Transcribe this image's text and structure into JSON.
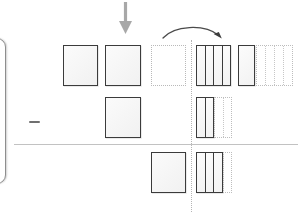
{
  "figure": {
    "title": "",
    "canvas": {
      "width": 298,
      "height": 212,
      "background": "#ffffff"
    },
    "colors": {
      "solid_stroke": "#3b3b3b",
      "ghost_stroke": "#b9b9b9",
      "rule": "#c2c2c2",
      "arrow_down": "#a8a8a8",
      "arrow_curve": "#4a4a4a",
      "panel_edge": "#8e8e8e",
      "tile_fill": "#f4f4f4"
    }
  },
  "annotations": {
    "down_arrow": {
      "name": "down-arrow",
      "x": 125,
      "y_top": 2,
      "y_bottom": 34,
      "color": "#a8a8a8"
    },
    "curved_arrow": {
      "name": "curved-arrow",
      "x_start": 164,
      "x_end": 221,
      "y": 36,
      "color": "#4a4a4a"
    },
    "minus_sign": {
      "name": "minus-sign",
      "x": 29,
      "y": 121,
      "width": 11
    },
    "horizontal_rule": {
      "name": "horizontal-rule",
      "x": 14,
      "y": 144,
      "width": 284
    },
    "vertical_dotted_rule": {
      "name": "vertical-dotted-rule",
      "x": 191,
      "y_top": 40,
      "y_bottom": 212
    },
    "panel_edge": {
      "name": "left-panel-edge",
      "x": -16,
      "y": 38,
      "width": 22,
      "height": 146
    }
  },
  "left_group": {
    "label": "source-tiles",
    "rows": [
      {
        "row": 1,
        "tiles": [
          {
            "kind": "solid",
            "x": 63,
            "y": 45,
            "w": 35,
            "h": 41
          },
          {
            "kind": "solid",
            "x": 105,
            "y": 45,
            "w": 36,
            "h": 41
          },
          {
            "kind": "ghost",
            "x": 151,
            "y": 45,
            "w": 35,
            "h": 41
          }
        ]
      },
      {
        "row": 2,
        "tiles": [
          {
            "kind": "solid",
            "x": 105,
            "y": 97,
            "w": 36,
            "h": 41
          }
        ]
      },
      {
        "row": 3,
        "tiles": [
          {
            "kind": "solid",
            "x": 151,
            "y": 152,
            "w": 35,
            "h": 41
          }
        ]
      }
    ]
  },
  "right_group": {
    "label": "column-blocks",
    "rows": [
      {
        "row": 1,
        "blocks": [
          {
            "kind": "striped",
            "columns": 4,
            "x": 196,
            "y": 45,
            "w": 35,
            "h": 41
          },
          {
            "kind": "striped",
            "columns": 1,
            "x": 238,
            "y": 45,
            "w": 17,
            "h": 41
          },
          {
            "kind": "ghost-striped",
            "columns": 4,
            "x": 256,
            "y": 45,
            "w": 37,
            "h": 41
          }
        ]
      },
      {
        "row": 2,
        "blocks": [
          {
            "kind": "striped",
            "columns": 2,
            "x": 196,
            "y": 97,
            "w": 18,
            "h": 41
          },
          {
            "kind": "ghost-striped",
            "columns": 2,
            "x": 214,
            "y": 97,
            "w": 18,
            "h": 41
          }
        ]
      },
      {
        "row": 3,
        "blocks": [
          {
            "kind": "striped",
            "columns": 3,
            "x": 196,
            "y": 152,
            "w": 27,
            "h": 41
          },
          {
            "kind": "ghost-striped",
            "columns": 1,
            "x": 223,
            "y": 152,
            "w": 9,
            "h": 41
          }
        ]
      }
    ]
  }
}
